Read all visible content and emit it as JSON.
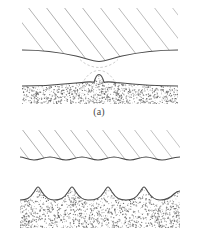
{
  "figure": {
    "background_color": "#ffffff",
    "width": 198,
    "height": 248,
    "line_color": "#4a4a4a",
    "hatch_color": "#9a9a9a",
    "stipple_color": "#6b6b6b",
    "dashed_color": "#b4b4b4"
  },
  "panels": [
    {
      "id": "a",
      "caption": "(a)",
      "description": "Single large asperity contact: upper hatched body with one central concave dip meeting lower stippled body with one central convex bump",
      "upper_body": {
        "name": "hatched-body",
        "fill_pattern": "diagonal-hatch",
        "hatch_line_count": 9,
        "hatch_angle_deg": 52,
        "profile": "single-central-concave-dip",
        "dip_count": 1
      },
      "lower_body": {
        "name": "stippled-body",
        "fill_pattern": "stipple",
        "profile": "single-central-convex-bump",
        "bump_count": 1,
        "dot_count": 1500
      }
    },
    {
      "id": "b",
      "caption": "(b)",
      "description": "Multiple asperity contact: upper hatched body with five shallow scallops meeting lower stippled body with five convex bumps",
      "upper_body": {
        "name": "hatched-body",
        "fill_pattern": "diagonal-hatch",
        "hatch_line_count": 11,
        "hatch_angle_deg": 52,
        "profile": "multi-scalloped-wave",
        "dip_count": 5
      },
      "lower_body": {
        "name": "stippled-body",
        "fill_pattern": "stipple",
        "profile": "multi-convex-bumps",
        "bump_count": 5,
        "dot_count": 1700
      }
    }
  ]
}
